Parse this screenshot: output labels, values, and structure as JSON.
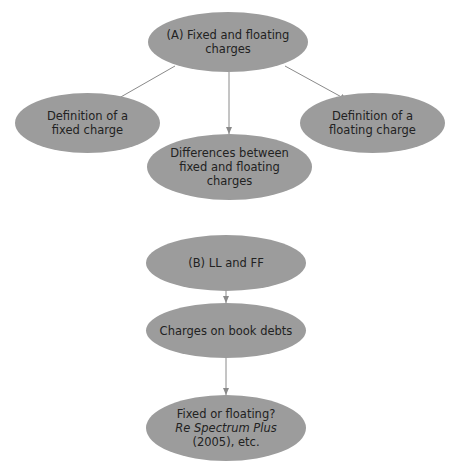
{
  "diagram": {
    "colors": {
      "node_fill": "#9c9c9c",
      "text": "#222222",
      "arrow": "#8a8a8a",
      "background": "#ffffff"
    },
    "group_a": {
      "root": {
        "lines": [
          "(A) Fixed and floating",
          "charges"
        ]
      },
      "left": {
        "lines": [
          "Definition of a",
          "fixed charge"
        ]
      },
      "middle": {
        "lines": [
          "Differences between",
          "fixed and floating",
          "charges"
        ]
      },
      "right": {
        "lines": [
          "Definition of a",
          "floating charge"
        ]
      }
    },
    "group_b": {
      "root": {
        "lines": [
          "(B) LL and FF"
        ]
      },
      "step1": {
        "lines": [
          "Charges on book debts"
        ]
      },
      "step2": {
        "line1": "Fixed or floating?",
        "line2": "Re Spectrum Plus",
        "line3": "(2005), etc."
      }
    }
  }
}
